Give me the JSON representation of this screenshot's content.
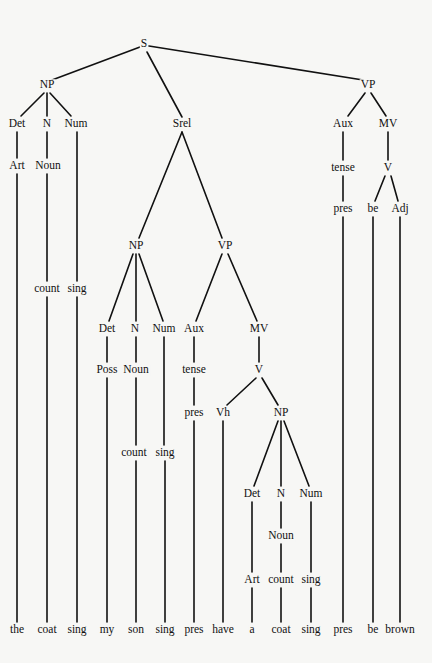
{
  "diagram": {
    "type": "syntax-tree",
    "sentence": [
      "the",
      "coat",
      "sing",
      "my",
      "son",
      "sing",
      "pres",
      "have",
      "a",
      "coat",
      "sing",
      "pres",
      "be",
      "brown"
    ],
    "nodes": [
      {
        "id": "S",
        "label": "S",
        "x": 144,
        "y": 44
      },
      {
        "id": "NP1",
        "label": "NP",
        "x": 47,
        "y": 85
      },
      {
        "id": "Det1",
        "label": "Det",
        "x": 17,
        "y": 124
      },
      {
        "id": "N1",
        "label": "N",
        "x": 47,
        "y": 124
      },
      {
        "id": "Num1",
        "label": "Num",
        "x": 76,
        "y": 124
      },
      {
        "id": "Art1",
        "label": "Art",
        "x": 17,
        "y": 166
      },
      {
        "id": "Noun1",
        "label": "Noun",
        "x": 48,
        "y": 166
      },
      {
        "id": "count1",
        "label": "count",
        "x": 47,
        "y": 289
      },
      {
        "id": "sing1",
        "label": "sing",
        "x": 77,
        "y": 289
      },
      {
        "id": "Srel",
        "label": "Srel",
        "x": 182,
        "y": 124
      },
      {
        "id": "NP2",
        "label": "NP",
        "x": 136,
        "y": 246
      },
      {
        "id": "Det2",
        "label": "Det",
        "x": 107,
        "y": 329
      },
      {
        "id": "N2",
        "label": "N",
        "x": 135,
        "y": 329
      },
      {
        "id": "Num2",
        "label": "Num",
        "x": 164,
        "y": 329
      },
      {
        "id": "Poss",
        "label": "Poss",
        "x": 107,
        "y": 370
      },
      {
        "id": "Noun2",
        "label": "Noun",
        "x": 136,
        "y": 370
      },
      {
        "id": "count2",
        "label": "count",
        "x": 134,
        "y": 453
      },
      {
        "id": "sing2",
        "label": "sing",
        "x": 165,
        "y": 453
      },
      {
        "id": "VP2",
        "label": "VP",
        "x": 225,
        "y": 246
      },
      {
        "id": "Aux2",
        "label": "Aux",
        "x": 194,
        "y": 329
      },
      {
        "id": "tense2",
        "label": "tense",
        "x": 194,
        "y": 370
      },
      {
        "id": "pres2",
        "label": "pres",
        "x": 194,
        "y": 413
      },
      {
        "id": "MV2",
        "label": "MV",
        "x": 259,
        "y": 329
      },
      {
        "id": "V2",
        "label": "V",
        "x": 259,
        "y": 370
      },
      {
        "id": "Vh",
        "label": "Vh",
        "x": 223,
        "y": 413
      },
      {
        "id": "NP3",
        "label": "NP",
        "x": 281,
        "y": 413
      },
      {
        "id": "Det3",
        "label": "Det",
        "x": 252,
        "y": 494
      },
      {
        "id": "N3",
        "label": "N",
        "x": 281,
        "y": 494
      },
      {
        "id": "Num3",
        "label": "Num",
        "x": 311,
        "y": 494
      },
      {
        "id": "Noun3",
        "label": "Noun",
        "x": 281,
        "y": 536
      },
      {
        "id": "Art3",
        "label": "Art",
        "x": 252,
        "y": 580
      },
      {
        "id": "count3",
        "label": "count",
        "x": 281,
        "y": 580
      },
      {
        "id": "sing3",
        "label": "sing",
        "x": 311,
        "y": 580
      },
      {
        "id": "VP1",
        "label": "VP",
        "x": 368,
        "y": 85
      },
      {
        "id": "Aux1",
        "label": "Aux",
        "x": 343,
        "y": 124
      },
      {
        "id": "MV1",
        "label": "MV",
        "x": 388,
        "y": 124
      },
      {
        "id": "tense1",
        "label": "tense",
        "x": 343,
        "y": 168
      },
      {
        "id": "V1",
        "label": "V",
        "x": 388,
        "y": 168
      },
      {
        "id": "pres1",
        "label": "pres",
        "x": 343,
        "y": 209
      },
      {
        "id": "be1",
        "label": "be",
        "x": 373,
        "y": 209
      },
      {
        "id": "Adj",
        "label": "Adj",
        "x": 400,
        "y": 209
      }
    ],
    "leaves": [
      {
        "label": "the",
        "x": 17,
        "y": 630
      },
      {
        "label": "coat",
        "x": 47,
        "y": 630
      },
      {
        "label": "sing",
        "x": 77,
        "y": 630
      },
      {
        "label": "my",
        "x": 107,
        "y": 630
      },
      {
        "label": "son",
        "x": 136,
        "y": 630
      },
      {
        "label": "sing",
        "x": 165,
        "y": 630
      },
      {
        "label": "pres",
        "x": 194,
        "y": 630
      },
      {
        "label": "have",
        "x": 223,
        "y": 630
      },
      {
        "label": "a",
        "x": 252,
        "y": 630
      },
      {
        "label": "coat",
        "x": 281,
        "y": 630
      },
      {
        "label": "sing",
        "x": 311,
        "y": 630
      },
      {
        "label": "pres",
        "x": 343,
        "y": 630
      },
      {
        "label": "be",
        "x": 373,
        "y": 630
      },
      {
        "label": "brown",
        "x": 400,
        "y": 630
      }
    ],
    "edges": [
      [
        140,
        47,
        52,
        80
      ],
      [
        149,
        46,
        363,
        80
      ],
      [
        147,
        52,
        182,
        117
      ],
      [
        44,
        93,
        21,
        116
      ],
      [
        47,
        93,
        47,
        116
      ],
      [
        50,
        93,
        71,
        116
      ],
      [
        17,
        132,
        17,
        158
      ],
      [
        47,
        132,
        47,
        158
      ],
      [
        77,
        132,
        77,
        281
      ],
      [
        17,
        174,
        17,
        622
      ],
      [
        47,
        174,
        47,
        281
      ],
      [
        47,
        297,
        47,
        622
      ],
      [
        77,
        297,
        77,
        622
      ],
      [
        182,
        132,
        139,
        238
      ],
      [
        182,
        132,
        222,
        238
      ],
      [
        133,
        254,
        109,
        321
      ],
      [
        136,
        254,
        136,
        321
      ],
      [
        139,
        254,
        163,
        321
      ],
      [
        107,
        337,
        107,
        362
      ],
      [
        136,
        337,
        136,
        362
      ],
      [
        164,
        337,
        164,
        445
      ],
      [
        107,
        378,
        107,
        622
      ],
      [
        136,
        378,
        136,
        445
      ],
      [
        136,
        461,
        136,
        622
      ],
      [
        165,
        461,
        165,
        622
      ],
      [
        222,
        254,
        196,
        321
      ],
      [
        228,
        254,
        257,
        321
      ],
      [
        194,
        337,
        194,
        362
      ],
      [
        194,
        378,
        194,
        405
      ],
      [
        194,
        421,
        194,
        622
      ],
      [
        259,
        337,
        259,
        362
      ],
      [
        256,
        378,
        227,
        405
      ],
      [
        262,
        378,
        278,
        405
      ],
      [
        223,
        421,
        223,
        622
      ],
      [
        278,
        421,
        254,
        486
      ],
      [
        281,
        421,
        281,
        486
      ],
      [
        284,
        421,
        309,
        486
      ],
      [
        252,
        502,
        252,
        572
      ],
      [
        281,
        502,
        281,
        528
      ],
      [
        281,
        544,
        281,
        572
      ],
      [
        311,
        502,
        311,
        572
      ],
      [
        252,
        588,
        252,
        622
      ],
      [
        281,
        588,
        281,
        622
      ],
      [
        311,
        588,
        311,
        622
      ],
      [
        365,
        93,
        348,
        116
      ],
      [
        371,
        93,
        386,
        116
      ],
      [
        343,
        132,
        343,
        160
      ],
      [
        388,
        132,
        388,
        160
      ],
      [
        385,
        176,
        375,
        201
      ],
      [
        391,
        176,
        398,
        201
      ],
      [
        343,
        176,
        343,
        201
      ],
      [
        343,
        217,
        343,
        622
      ],
      [
        373,
        217,
        373,
        622
      ],
      [
        400,
        217,
        400,
        622
      ]
    ]
  }
}
